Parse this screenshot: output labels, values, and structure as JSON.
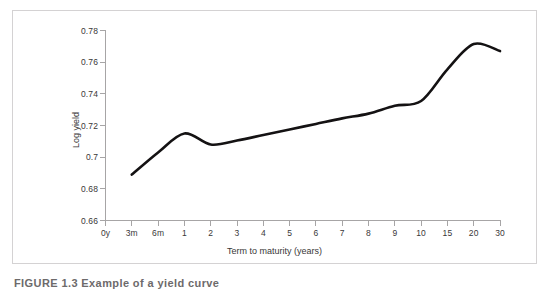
{
  "figure": {
    "caption": "FIGURE 1.3   Example of a yield curve",
    "background_color": "#ffffff",
    "frame_color": "#d4d2d3"
  },
  "chart_data": {
    "type": "line",
    "title": "",
    "xlabel": "Term to maturity (years)",
    "ylabel": "Log yield",
    "grid": false,
    "legend": null,
    "line_color": "#141213",
    "axis_color": "#a7a5a6",
    "ylim": [
      0.66,
      0.78
    ],
    "ytick_labels": [
      "0.78",
      "0.76",
      "0.74",
      "0.72",
      "0.7",
      "0.68",
      "0.66"
    ],
    "ytick_values": [
      0.78,
      0.76,
      0.74,
      0.72,
      0.7,
      0.68,
      0.66
    ],
    "xtick_labels": [
      "0y",
      "3m",
      "6m",
      "1",
      "2",
      "3",
      "4",
      "5",
      "6",
      "7",
      "8",
      "9",
      "10",
      "15",
      "20",
      "30"
    ],
    "x_is_categorical": true,
    "x_index_range": [
      0,
      15
    ],
    "categories": [
      "0y",
      "3m",
      "6m",
      "1",
      "2",
      "3",
      "4",
      "5",
      "6",
      "7",
      "8",
      "9",
      "10",
      "15",
      "20",
      "30"
    ],
    "values": [
      null,
      0.689,
      0.703,
      0.715,
      0.708,
      0.7105,
      0.714,
      0.7175,
      0.721,
      0.7245,
      0.7275,
      0.7325,
      0.7355,
      0.7555,
      0.7715,
      0.767
    ],
    "series": [
      {
        "name": "Log yield",
        "points": [
          {
            "x": "3m",
            "y": 0.689
          },
          {
            "x": "6m",
            "y": 0.703
          },
          {
            "x": "1",
            "y": 0.715
          },
          {
            "x": "2",
            "y": 0.708
          },
          {
            "x": "3",
            "y": 0.7105
          },
          {
            "x": "4",
            "y": 0.714
          },
          {
            "x": "5",
            "y": 0.7175
          },
          {
            "x": "6",
            "y": 0.721
          },
          {
            "x": "7",
            "y": 0.7245
          },
          {
            "x": "8",
            "y": 0.7275
          },
          {
            "x": "9",
            "y": 0.7325
          },
          {
            "x": "10",
            "y": 0.7355
          },
          {
            "x": "15",
            "y": 0.7555
          },
          {
            "x": "20",
            "y": 0.7715
          },
          {
            "x": "30",
            "y": 0.767
          }
        ]
      }
    ]
  }
}
